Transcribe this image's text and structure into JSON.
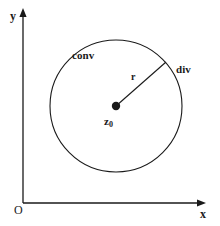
{
  "figure": {
    "type": "math-diagram",
    "background_color": "#ffffff",
    "stroke_color": "#1a1a1a",
    "axes": {
      "origin_label": "O",
      "x_axis_label": "x",
      "y_axis_label": "y",
      "x_axis": {
        "x1": 23,
        "y1": 203,
        "x2": 205,
        "y2": 203,
        "arrow": "right"
      },
      "y_axis": {
        "x1": 23,
        "y1": 203,
        "x2": 23,
        "y2": 10,
        "arrow": "up"
      }
    },
    "circle": {
      "center_x": 116,
      "center_y": 106,
      "radius": 66,
      "fill": "none",
      "stroke_width": 1
    },
    "center_point": {
      "x": 116,
      "y": 106,
      "dot_radius": 4,
      "label_base": "z",
      "label_sub": "0"
    },
    "radius_line": {
      "x1": 116,
      "y1": 106,
      "x2": 166,
      "y2": 62,
      "label": "r"
    },
    "region_inside_label": "conv",
    "region_outside_label": "div"
  }
}
